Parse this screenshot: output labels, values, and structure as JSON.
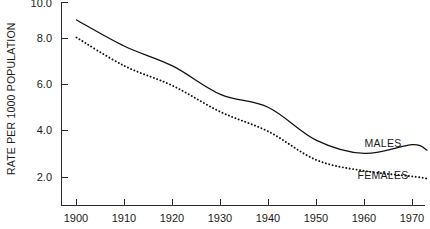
{
  "chart_data": {
    "type": "line",
    "title": "",
    "xlabel": "",
    "ylabel": "RATE PER 1000 POPULATION",
    "x": [
      1900,
      1910,
      1920,
      1930,
      1940,
      1950,
      1960,
      1970
    ],
    "xlim": [
      1900,
      1973
    ],
    "ylim": [
      1.6,
      10.0
    ],
    "xticks": [
      1900,
      1910,
      1920,
      1930,
      1940,
      1950,
      1960,
      1970
    ],
    "xtick_labels": [
      "1900",
      "1910",
      "1920",
      "1930",
      "1940",
      "1950",
      "1960",
      "1970"
    ],
    "yticks": [
      2.0,
      4.0,
      6.0,
      8.0,
      10.0
    ],
    "ytick_labels": [
      "2.0",
      "4.0",
      "6.0",
      "8.0",
      "10.0"
    ],
    "grid": false,
    "legend_position": "inline-right",
    "series": [
      {
        "name": "MALES",
        "style": "solid",
        "values": [
          9.2,
          8.0,
          7.1,
          5.8,
          5.2,
          3.7,
          3.1,
          3.5
        ],
        "end_x": 1973,
        "end_value": 3.25
      },
      {
        "name": "FEMALES",
        "style": "dotted",
        "values": [
          8.4,
          7.1,
          6.2,
          5.0,
          4.1,
          2.8,
          2.3,
          2.05
        ],
        "end_x": 1973,
        "end_value": 1.95
      }
    ],
    "annotations": [
      {
        "text": "MALES",
        "x": 1965,
        "y": 4.35
      },
      {
        "text": "FEMALES",
        "x": 1963,
        "y": 2.75
      }
    ]
  },
  "axis": {
    "y_title": "RATE PER 1000 POPULATION"
  }
}
